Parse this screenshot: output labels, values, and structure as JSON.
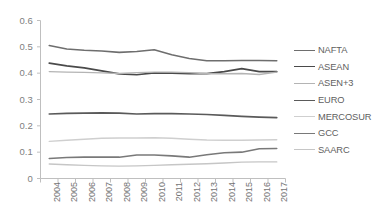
{
  "chart_data": {
    "type": "line",
    "title": "",
    "xlabel": "",
    "ylabel": "",
    "x": [
      "2004",
      "2005",
      "2006",
      "2007",
      "2008",
      "2009",
      "2010",
      "2011",
      "2012",
      "2013",
      "2014",
      "2015",
      "2016",
      "2017"
    ],
    "categories": [
      "2004",
      "2005",
      "2006",
      "2007",
      "2008",
      "2009",
      "2010",
      "2011",
      "2012",
      "2013",
      "2014",
      "2015",
      "2016",
      "2017"
    ],
    "ylim": [
      0,
      0.6
    ],
    "yticks": [
      0,
      0.1,
      0.2,
      0.3,
      0.4,
      0.5,
      0.6
    ],
    "ytick_labels": [
      "0",
      "0.1",
      "0.2",
      "0.3",
      "0.4",
      "0.5",
      "0.6"
    ],
    "grid": false,
    "legend_position": "right",
    "series": [
      {
        "name": "NAFTA",
        "color": "#6E6E6E",
        "width": 1.6,
        "values": [
          0.505,
          0.492,
          0.487,
          0.484,
          0.479,
          0.482,
          0.489,
          0.47,
          0.456,
          0.447,
          0.447,
          0.448,
          0.448,
          0.447
        ]
      },
      {
        "name": "ASEAN",
        "color": "#4A4A4A",
        "width": 1.7,
        "values": [
          0.438,
          0.428,
          0.42,
          0.409,
          0.397,
          0.394,
          0.401,
          0.4,
          0.398,
          0.398,
          0.406,
          0.417,
          0.406,
          0.406
        ]
      },
      {
        "name": "ASEN+3",
        "color": "#B4B4B4",
        "width": 1.4,
        "values": [
          0.406,
          0.404,
          0.403,
          0.401,
          0.399,
          0.402,
          0.404,
          0.404,
          0.402,
          0.398,
          0.398,
          0.399,
          0.395,
          0.404
        ]
      },
      {
        "name": "EURO",
        "color": "#5A5A5A",
        "width": 1.7,
        "values": [
          0.245,
          0.247,
          0.248,
          0.249,
          0.248,
          0.245,
          0.246,
          0.246,
          0.245,
          0.243,
          0.24,
          0.236,
          0.233,
          0.231
        ]
      },
      {
        "name": "MERCOSUR",
        "color": "#CFCFCF",
        "width": 1.4,
        "values": [
          0.141,
          0.145,
          0.149,
          0.153,
          0.154,
          0.154,
          0.155,
          0.153,
          0.149,
          0.146,
          0.145,
          0.145,
          0.146,
          0.147
        ]
      },
      {
        "name": "GCC",
        "color": "#797979",
        "width": 1.6,
        "values": [
          0.076,
          0.08,
          0.081,
          0.081,
          0.081,
          0.089,
          0.089,
          0.086,
          0.081,
          0.09,
          0.098,
          0.1,
          0.113,
          0.114
        ]
      },
      {
        "name": "SAARC",
        "color": "#C6C6C6",
        "width": 1.4,
        "values": [
          0.055,
          0.052,
          0.05,
          0.048,
          0.047,
          0.048,
          0.05,
          0.052,
          0.054,
          0.056,
          0.059,
          0.062,
          0.063,
          0.063
        ]
      }
    ]
  },
  "axis": {
    "line_color": "#BFBFBF",
    "tick_color": "#BFBFBF"
  },
  "legend": {
    "items": [
      {
        "label": "NAFTA"
      },
      {
        "label": "ASEAN"
      },
      {
        "label": "ASEN+3"
      },
      {
        "label": "EURO"
      },
      {
        "label": "MERCOSUR"
      },
      {
        "label": "GCC"
      },
      {
        "label": "SAARC"
      }
    ]
  }
}
